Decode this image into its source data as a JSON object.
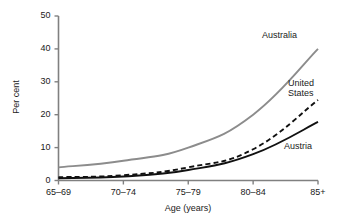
{
  "chart_data": {
    "type": "line",
    "title": "",
    "xlabel": "Age (years)",
    "ylabel": "Per cent",
    "categories": [
      "65–69",
      "70–74",
      "75–79",
      "80–84",
      "85+"
    ],
    "ylim": [
      0,
      50
    ],
    "yticks": [
      0,
      10,
      20,
      30,
      40,
      50
    ],
    "ytick_labels": [
      "0",
      "10",
      "20",
      "30",
      "40",
      "50"
    ],
    "grid": false,
    "legend_position": "inline-right-annotations",
    "series": [
      {
        "name": "Australia",
        "values": [
          4,
          6,
          10,
          20,
          40
        ],
        "color": "#8c8c8c",
        "style": "solid",
        "label_text": "Australia"
      },
      {
        "name": "United States",
        "values": [
          1,
          1.6,
          4,
          9.5,
          24.5
        ],
        "color": "#111111",
        "style": "dashed",
        "label_text": "United\nStates"
      },
      {
        "name": "Austria",
        "values": [
          0.7,
          1.2,
          3.2,
          8,
          17.8
        ],
        "color": "#111111",
        "style": "solid",
        "label_text": "Austria"
      }
    ]
  },
  "axis_color": "#777777",
  "annotations": [
    {
      "name": "australia",
      "text": "Australia"
    },
    {
      "name": "united-states",
      "text": "United\nStates"
    },
    {
      "name": "austria",
      "text": "Austria"
    }
  ]
}
